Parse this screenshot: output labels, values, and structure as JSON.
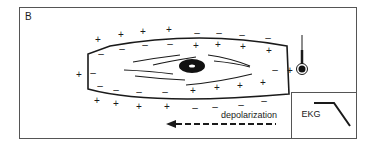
{
  "panel": {
    "label": "B"
  },
  "cell": {
    "outer_signs": {
      "top": [
        "+",
        "+",
        "+",
        "+"
      ],
      "top_right": [
        "-",
        "-",
        "-",
        "-"
      ],
      "bottom": [
        "+",
        "+",
        "+",
        "+"
      ],
      "bottom_right": [
        "-",
        "-",
        "-",
        "-"
      ],
      "left": "+",
      "right": "+"
    },
    "inner_signs": {
      "top_left": [
        "-",
        "-",
        "-",
        "-"
      ],
      "top_right": [
        "+",
        "+",
        "+",
        "+"
      ],
      "bottom_left": [
        "-",
        "-",
        "-",
        "-"
      ],
      "bottom_right": [
        "+",
        "+",
        "+",
        "+"
      ],
      "left": "-",
      "right": "-"
    }
  },
  "electrode": {
    "sign": "+"
  },
  "arrow": {
    "label": "depolarization",
    "direction": "left"
  },
  "ekg_inset": {
    "label": "EKG"
  },
  "colors": {
    "stroke": "#1a1a1a",
    "background": "#ffffff"
  }
}
